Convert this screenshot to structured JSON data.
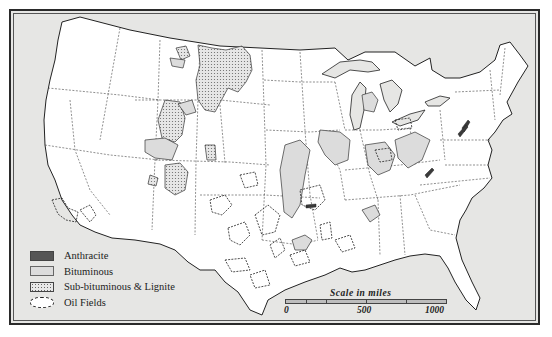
{
  "map": {
    "title": "Coal and Oil Fields of the United States",
    "background_color": "#e6e6e4",
    "land_color": "#ffffff",
    "colors": {
      "anthracite": "#555555",
      "bituminous": "#dcdcdc",
      "sub_bituminous_lignite": "#e8e8e8",
      "oil_fields_outline": "#222222"
    }
  },
  "legend": {
    "items": [
      {
        "label": "Anthracite",
        "icon": "dark-fill-swatch"
      },
      {
        "label": "Bituminous",
        "icon": "light-fill-swatch"
      },
      {
        "label": "Sub-bituminous & Lignite",
        "icon": "dotted-fill-swatch"
      },
      {
        "label": "Oil Fields",
        "icon": "dashed-outline-swatch"
      }
    ]
  },
  "scale": {
    "title": "Scale  in  miles",
    "labels": [
      "0",
      "500",
      "1000"
    ]
  }
}
